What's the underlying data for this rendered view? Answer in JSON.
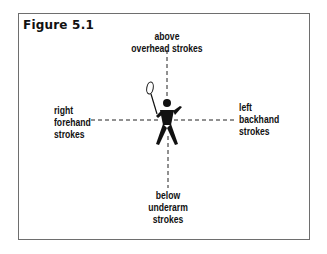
{
  "figure": {
    "title": "Figure 5.1",
    "directions": {
      "top": {
        "lines": [
          "above",
          "overhead strokes"
        ]
      },
      "left": {
        "lines": [
          "right",
          "forehand",
          "strokes"
        ]
      },
      "right": {
        "lines": [
          "left",
          "backhand",
          "strokes"
        ]
      },
      "bottom": {
        "lines": [
          "below",
          "underarm",
          "strokes"
        ]
      }
    },
    "center_icon": "badminton-player-icon",
    "axes_style": "dashed",
    "colors": {
      "ink": "#111111",
      "frame": "#6e6e6e",
      "background": "#ffffff"
    }
  }
}
